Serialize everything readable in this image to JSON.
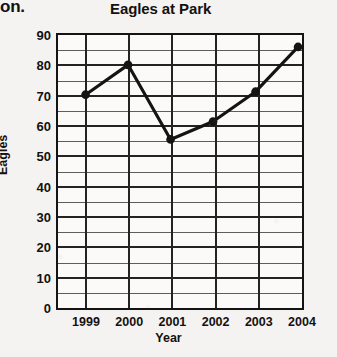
{
  "page": {
    "cropped_text_fragment": "on.",
    "background_color": "#f4f3f1"
  },
  "chart_data": {
    "type": "line",
    "title": "Eagles at Park",
    "xlabel": "Year",
    "ylabel": "Eagles",
    "categories": [
      "1999",
      "2000",
      "2001",
      "2002",
      "2003",
      "2004"
    ],
    "values": [
      70,
      80,
      55,
      61,
      71,
      86
    ],
    "series": [
      {
        "name": "Eagles",
        "values": [
          70,
          80,
          55,
          61,
          71,
          86
        ]
      }
    ],
    "ylim": [
      0,
      90
    ],
    "y_ticks": [
      0,
      10,
      20,
      30,
      40,
      50,
      60,
      70,
      80,
      90
    ],
    "y_minor_step": 5,
    "grid": true,
    "legend": "none",
    "line_color": "#141414",
    "marker": "circle",
    "marker_color": "#141414"
  }
}
